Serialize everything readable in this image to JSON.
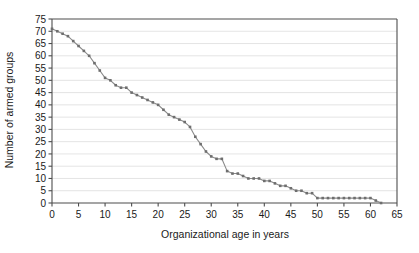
{
  "chart_data": {
    "type": "line",
    "title": "",
    "subtitle": "",
    "xlabel": "Organizational age in years",
    "ylabel": "Number of armed groups",
    "xlim": [
      0,
      65
    ],
    "ylim": [
      0,
      75
    ],
    "xticks": [
      0,
      5,
      10,
      15,
      20,
      25,
      30,
      35,
      40,
      45,
      50,
      55,
      60,
      65
    ],
    "yticks": [
      0,
      5,
      10,
      15,
      20,
      25,
      30,
      35,
      40,
      45,
      50,
      55,
      60,
      65,
      70,
      75
    ],
    "xtick_labels": [
      "0",
      "5",
      "10",
      "15",
      "20",
      "25",
      "30",
      "35",
      "40",
      "45",
      "50",
      "55",
      "60",
      "65"
    ],
    "ytick_labels": [
      "0",
      "5",
      "10",
      "15",
      "20",
      "25",
      "30",
      "35",
      "40",
      "45",
      "50",
      "55",
      "60",
      "65",
      "70",
      "75"
    ],
    "grid": "horizontal",
    "legend": "none",
    "marker": "small-square",
    "line_color": "#8a8a8a",
    "marker_color": "#6e6e6e",
    "grid_color": "#d9d9d9",
    "axis_color": "#4d4d4d",
    "series": [
      {
        "name": "Number of armed groups",
        "x": [
          0,
          1,
          2,
          3,
          4,
          5,
          6,
          7,
          8,
          9,
          10,
          11,
          12,
          13,
          14,
          15,
          16,
          17,
          18,
          19,
          20,
          21,
          22,
          23,
          24,
          25,
          26,
          27,
          28,
          29,
          30,
          31,
          32,
          33,
          34,
          35,
          36,
          37,
          38,
          39,
          40,
          41,
          42,
          43,
          44,
          45,
          46,
          47,
          48,
          49,
          50,
          51,
          52,
          53,
          54,
          55,
          56,
          57,
          58,
          59,
          60,
          61,
          62
        ],
        "values": [
          71,
          70,
          69,
          68,
          66,
          64,
          62,
          60,
          57,
          54,
          51,
          50,
          48,
          47,
          47,
          45,
          44,
          43,
          42,
          41,
          40,
          38,
          36,
          35,
          34,
          33,
          31,
          27,
          24,
          21,
          19,
          18,
          18,
          13,
          12,
          12,
          11,
          10,
          10,
          10,
          9,
          9,
          8,
          7,
          7,
          6,
          5,
          5,
          4,
          4,
          2,
          2,
          2,
          2,
          2,
          2,
          2,
          2,
          2,
          2,
          2,
          1,
          0
        ]
      }
    ]
  }
}
